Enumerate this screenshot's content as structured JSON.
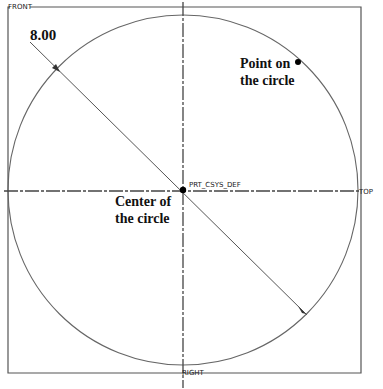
{
  "diagram": {
    "datum_planes": {
      "front": "FRONT",
      "top": "TOP",
      "right": "RIGHT"
    },
    "coordinate_system": "PRT_CSYS_DEF",
    "dimension": {
      "label": "8.00",
      "type": "diameter"
    },
    "annotations": {
      "point_on_circle": [
        "Point on",
        "the circle"
      ],
      "center_of_circle": [
        "Center of",
        "the circle"
      ]
    },
    "colors": {
      "line": "#555555",
      "text": "#111111",
      "point": "#000000"
    }
  }
}
